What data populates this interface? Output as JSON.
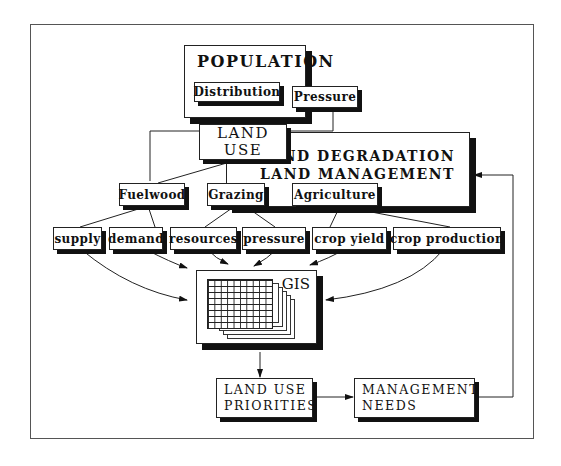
{
  "diagram": {
    "population": {
      "title": "POPULATION",
      "distribution": "Distribution",
      "pressure": "Pressure"
    },
    "land_use": {
      "line1": "LAND",
      "line2": "USE"
    },
    "land_degradation": {
      "line1": "LAND DEGRADATION",
      "line2": "LAND MANAGEMENT"
    },
    "categories": [
      {
        "label": "Fuelwood"
      },
      {
        "label": "Grazing"
      },
      {
        "label": "Agriculture"
      }
    ],
    "factors": [
      {
        "label": "supply"
      },
      {
        "label": "demand"
      },
      {
        "label": "resources"
      },
      {
        "label": "pressure"
      },
      {
        "label": "crop yield"
      },
      {
        "label": "crop production"
      }
    ],
    "gis": {
      "label": "GIS"
    },
    "outputs": {
      "priorities": {
        "line1": "LAND USE",
        "line2": "PRIORITIES"
      },
      "needs": {
        "line1": "MANAGEMENT",
        "line2": "NEEDS"
      }
    }
  }
}
